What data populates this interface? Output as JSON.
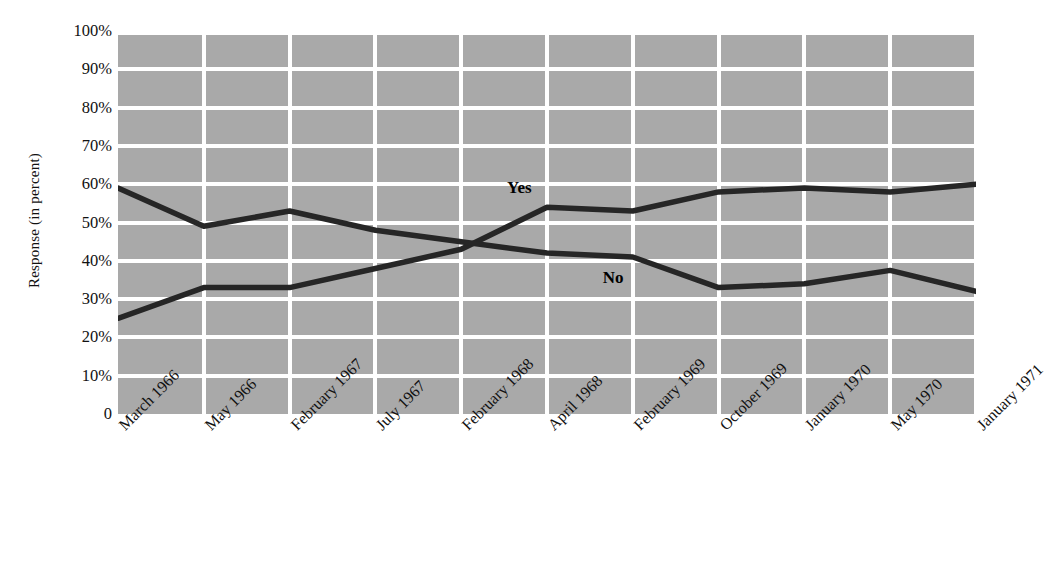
{
  "chart_data": {
    "type": "line",
    "title": "",
    "xlabel": "",
    "ylabel": "Response (in percent)",
    "categories": [
      "March 1966",
      "May 1966",
      "February 1967",
      "July 1967",
      "February 1968",
      "April 1968",
      "February 1969",
      "October 1969",
      "January 1970",
      "May 1970",
      "January 1971"
    ],
    "series": [
      {
        "name": "Yes",
        "values": [
          25,
          33,
          33,
          38,
          43,
          54,
          53,
          58,
          59,
          58,
          60
        ]
      },
      {
        "name": "No",
        "values": [
          59,
          49,
          53,
          48,
          45,
          42,
          41,
          33,
          34,
          37.5,
          32
        ]
      }
    ],
    "ylim": [
      0,
      100
    ],
    "ytick_labels": [
      "100%",
      "90%",
      "80%",
      "70%",
      "60%",
      "50%",
      "40%",
      "30%",
      "20%",
      "10%",
      "0"
    ],
    "ytick_values": [
      100,
      90,
      80,
      70,
      60,
      50,
      40,
      30,
      20,
      10,
      0
    ],
    "grid": true,
    "legend_position": "inline-annotations",
    "annotations": [
      {
        "text": "Yes",
        "series": "Yes",
        "near_category": "April 1968"
      },
      {
        "text": "No",
        "series": "No",
        "near_category": "February 1969"
      }
    ],
    "plot_background_color": "#a9a9a9",
    "gridline_color": "#ffffff",
    "line_color": "#262626"
  }
}
